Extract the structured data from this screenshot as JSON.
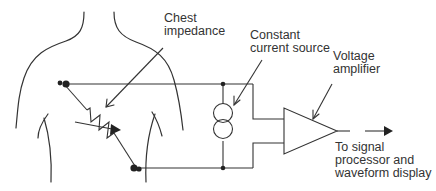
{
  "labels": {
    "chest_impedance": "Chest\nimpedance",
    "constant_current_source": "Constant\ncurrent source",
    "voltage_amplifier": "Voltage\namplifier",
    "output_destination": "To signal\nprocessor and\nwaveform display"
  },
  "colors": {
    "line": "#333333",
    "text": "#333333",
    "background": "#ffffff"
  }
}
